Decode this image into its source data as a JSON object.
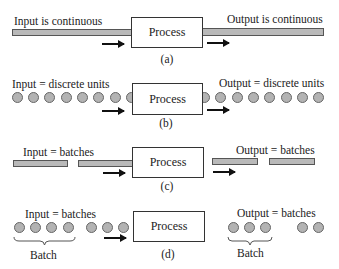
{
  "diagram": {
    "panels": [
      {
        "id": "a",
        "caption": "(a)",
        "process_label": "Process",
        "input_label": "Input is continuous",
        "output_label": "Output is continuous",
        "input_form": "continuous bar",
        "output_form": "continuous bar"
      },
      {
        "id": "b",
        "caption": "(b)",
        "process_label": "Process",
        "input_label": "Input = discrete units",
        "output_label": "Output = discrete units",
        "input_form": "discrete units (circles)",
        "output_form": "discrete units (circles)",
        "input_unit_count": 8,
        "output_unit_count": 8
      },
      {
        "id": "c",
        "caption": "(c)",
        "process_label": "Process",
        "input_label": "Input = batches",
        "output_label": "Output = batches",
        "input_form": "batch bars",
        "output_form": "batch bars",
        "input_batch_count": 2,
        "output_batch_count": 2
      },
      {
        "id": "d",
        "caption": "(d)",
        "process_label": "Process",
        "input_label": "Input = batches",
        "output_label": "Output = batches",
        "input_groups": [
          4,
          3
        ],
        "output_groups": [
          3,
          2
        ],
        "brace_label": "Batch"
      }
    ],
    "colors": {
      "unit_fill": "#b3b3b3",
      "bar_fill": "#b9b9b9",
      "stroke": "#333333",
      "arrow": "#111111"
    }
  }
}
